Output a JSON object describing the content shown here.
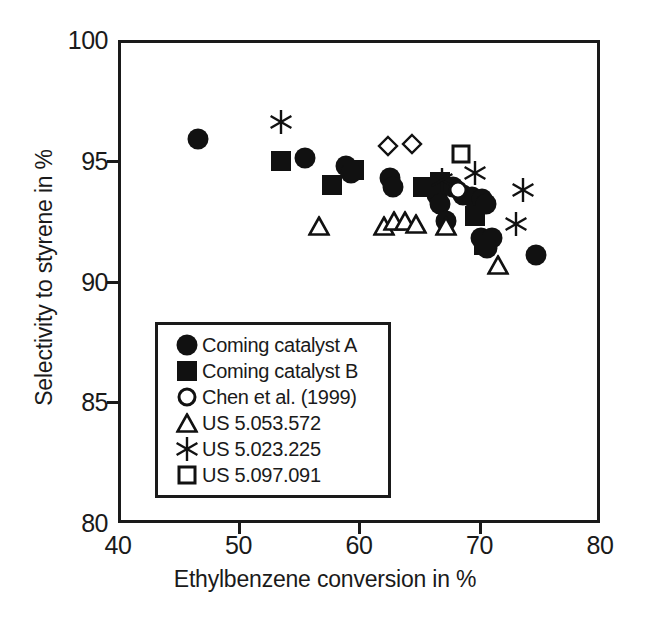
{
  "chart_data": {
    "type": "scatter",
    "title": "",
    "xlabel": "Ethylbenzene conversion in %",
    "ylabel": "Selectivity to styrene in %",
    "xlim": [
      40,
      80
    ],
    "ylim": [
      80,
      100
    ],
    "xticks": [
      "40",
      "50",
      "60",
      "70",
      "80"
    ],
    "xtick_values": [
      40,
      50,
      60,
      70,
      80
    ],
    "yticks": [
      "80",
      "85",
      "90",
      "95",
      "100"
    ],
    "ytick_values": [
      80,
      85,
      90,
      95,
      100
    ],
    "grid": false,
    "legend_position": "lower-left-inside",
    "series": [
      {
        "name": "Coming catalyst A",
        "marker": "circle-filled",
        "points": [
          [
            46.6,
            95.9
          ],
          [
            55.5,
            95.1
          ],
          [
            58.9,
            94.8
          ],
          [
            59.3,
            94.5
          ],
          [
            62.6,
            94.3
          ],
          [
            62.8,
            93.9
          ],
          [
            66.5,
            93.6
          ],
          [
            66.7,
            93.2
          ],
          [
            67.2,
            92.5
          ],
          [
            67.8,
            93.9
          ],
          [
            68.6,
            93.6
          ],
          [
            69.4,
            93.5
          ],
          [
            70.2,
            93.4
          ],
          [
            70.5,
            93.2
          ],
          [
            70.1,
            91.8
          ],
          [
            71.0,
            91.8
          ],
          [
            70.6,
            91.4
          ],
          [
            74.7,
            91.1
          ]
        ]
      },
      {
        "name": "Coming catalyst B",
        "marker": "square-filled",
        "points": [
          [
            53.5,
            95.0
          ],
          [
            57.8,
            94.0
          ],
          [
            59.6,
            94.6
          ],
          [
            65.3,
            93.9
          ],
          [
            66.7,
            94.1
          ],
          [
            69.6,
            92.7
          ],
          [
            70.4,
            91.5
          ]
        ]
      },
      {
        "name": "Chen et al. (1999)",
        "marker": "circle-open",
        "points": [
          [
            68.2,
            93.8
          ]
        ]
      },
      {
        "name": "US 5.053.572",
        "marker": "triangle-open",
        "points": [
          [
            56.7,
            92.3
          ],
          [
            62.1,
            92.3
          ],
          [
            62.9,
            92.5
          ],
          [
            63.8,
            92.5
          ],
          [
            64.7,
            92.4
          ],
          [
            67.2,
            92.3
          ],
          [
            71.5,
            90.7
          ]
        ]
      },
      {
        "name": "US 5.023.225",
        "marker": "asterisk",
        "points": [
          [
            53.5,
            96.6
          ],
          [
            66.9,
            94.2
          ],
          [
            69.6,
            94.5
          ],
          [
            73.6,
            93.8
          ],
          [
            73.0,
            92.4
          ]
        ]
      },
      {
        "name": "US 5.097.091",
        "marker": "square-open",
        "points": [
          [
            68.5,
            95.3
          ]
        ]
      },
      {
        "name": "unlabeled diamonds",
        "marker": "diamond-open",
        "points": [
          [
            62.4,
            95.6
          ],
          [
            64.4,
            95.7
          ]
        ]
      }
    ]
  },
  "legend": {
    "entries": [
      {
        "label": "Coming catalyst A",
        "marker": "circle-filled"
      },
      {
        "label": "Coming catalyst B",
        "marker": "square-filled"
      },
      {
        "label": "Chen et al. (1999)",
        "marker": "circle-open"
      },
      {
        "label": "US 5.053.572",
        "marker": "triangle-open"
      },
      {
        "label": "US 5.023.225",
        "marker": "asterisk"
      },
      {
        "label": "US 5.097.091",
        "marker": "square-open"
      }
    ]
  },
  "colors": {
    "ink": "#111111",
    "background": "#ffffff"
  }
}
